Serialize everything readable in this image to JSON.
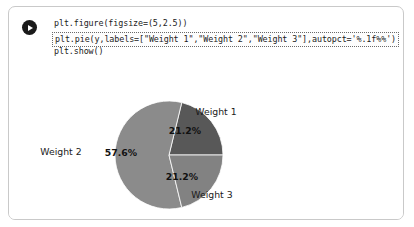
{
  "cell": {
    "run_button_label": "Run cell",
    "run_icon": "play-icon",
    "code_lines": [
      "plt.figure(figsize=(5,2.5))",
      "plt.pie(y,labels=[\"Weight 1\",\"Weight 2\",\"Weight 3\"],autopct='%.1f%%')",
      "plt.show()"
    ],
    "selected_line_index": 1
  },
  "colors": {
    "wedge_weight1": "#585858",
    "wedge_weight2": "#8b8b8b",
    "wedge_weight3": "#828282",
    "cell_border": "#c9c9c9",
    "run_button": "#1a1a1a",
    "background": "#ffffff",
    "text": "#1b1b1b"
  },
  "chart_data": {
    "type": "pie",
    "title": "",
    "labels": [
      "Weight 1",
      "Weight 2",
      "Weight 3"
    ],
    "values": [
      21.2,
      57.6,
      21.2
    ],
    "autopct": [
      "21.2%",
      "57.6%",
      "21.2%"
    ],
    "colors": [
      "#585858",
      "#8b8b8b",
      "#828282"
    ],
    "startangle": 0,
    "counterclock": true,
    "legend": "none",
    "grid": false,
    "figsize": [
      5,
      2.5
    ],
    "geometry": {
      "center_x": 160,
      "center_y": 76,
      "radius": 54
    },
    "label_positions": [
      {
        "text": "Weight 1",
        "x": 207,
        "y": 36
      },
      {
        "text": "Weight 2",
        "x": 52,
        "y": 76
      },
      {
        "text": "Weight 3",
        "x": 203,
        "y": 119
      }
    ],
    "pct_positions": [
      {
        "text": "21.2%",
        "x": 176,
        "y": 55
      },
      {
        "text": "57.6%",
        "x": 112,
        "y": 77
      },
      {
        "text": "21.2%",
        "x": 173,
        "y": 101
      }
    ]
  }
}
